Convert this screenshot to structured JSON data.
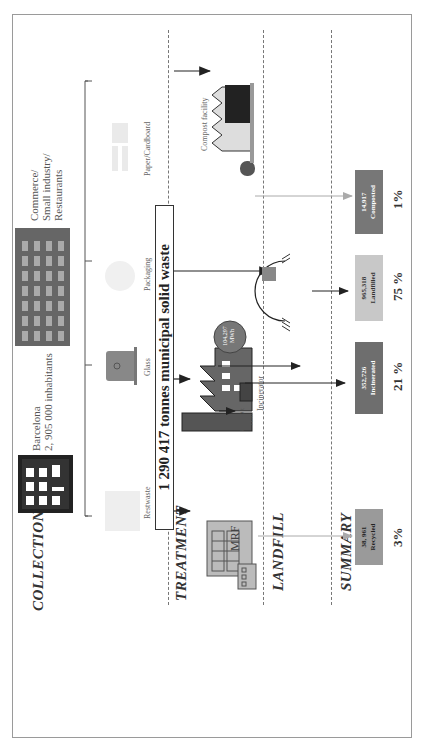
{
  "figure": {
    "zones": [
      "COLLECTION",
      "TREATMENT",
      "LANDFILL",
      "SUMMARY"
    ],
    "sources": {
      "residential": {
        "line1": "Barcelona",
        "line2": "2, 905 000 inhabitants"
      },
      "commercial": {
        "line1": "Commerce/",
        "line2": "Small industry/",
        "line3": "Restaurants"
      }
    },
    "waste_streams": [
      "Restwaste",
      "Glass",
      "Packaging",
      "Paper/Cardboard"
    ],
    "total_waste": "1 290 417 tonnes  municipal solid waste",
    "facilities": {
      "mrf": "MRF",
      "incinerator": "Incinerator",
      "compost": "Compost facility"
    },
    "incinerator_outputs": {
      "energy": {
        "value": "104,297",
        "unit": "MWh"
      },
      "ash": {
        "value": "81,460 t",
        "unit": "Ash"
      }
    },
    "summary": [
      {
        "value": "38, 961",
        "label": "Recycled",
        "percent": "3%",
        "color": "#9a9a9a"
      },
      {
        "value": "352,726",
        "label": "Incinerated",
        "percent": "21 %",
        "color": "#6e6e6e"
      },
      {
        "value": "965,318",
        "label": "Landfilled",
        "percent": "75 %",
        "color": "#c8c8c8"
      },
      {
        "value": "14,917",
        "label": "Composted",
        "percent": "1%",
        "color": "#777777"
      }
    ],
    "colors": {
      "frame": "#9a9a9a",
      "arrow_dark": "#222222",
      "arrow_light": "#aaaaaa",
      "energy_circle": "#777777",
      "building_dark": "#333333"
    }
  }
}
